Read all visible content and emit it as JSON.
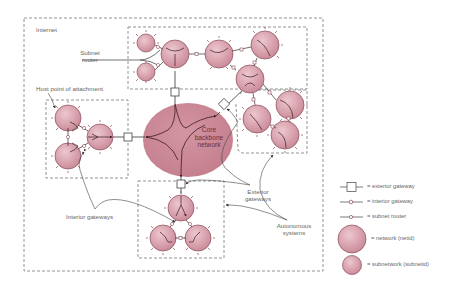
{
  "labels": {
    "internet": "Internet",
    "subnet_router_1": "Subnet",
    "subnet_router_2": "router",
    "host_point": "Host point of attachment",
    "core_1": "Core",
    "core_2": "backbone",
    "core_3": "network",
    "exterior_gateways_1": "Exterior",
    "exterior_gateways_2": "gateways",
    "interior_gateways": "Interior gateways",
    "autonomous_systems_1": "Autonomous",
    "autonomous_systems_2": "systems"
  },
  "legend": {
    "items": [
      {
        "symbol": "exterior-gateway",
        "label": "= exterior gateway"
      },
      {
        "symbol": "interior-gateway",
        "label": "= interior gateway"
      },
      {
        "symbol": "subnet-router",
        "label": "= subnet router"
      },
      {
        "symbol": "network",
        "label": "= network (netid)"
      },
      {
        "symbol": "subnetwork",
        "label": "= subnetwork (subnetid)"
      }
    ]
  },
  "colors": {
    "network_fill": "#d9a3ae",
    "network_stroke": "#8a4a5a",
    "core_fill": "#c98593",
    "line": "#444444",
    "dashed": "#777777"
  }
}
